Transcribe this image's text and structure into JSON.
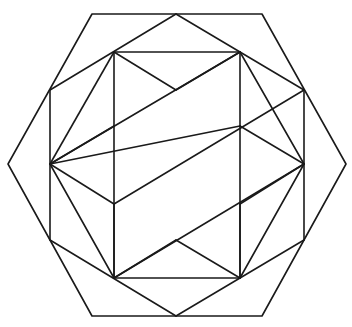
{
  "diagram": {
    "title": "",
    "width": 352,
    "height": 327,
    "stroke_color": "#1a1a1a",
    "background": "#ffffff",
    "outer_hexagon": [
      [
        92,
        14
      ],
      [
        262,
        14
      ],
      [
        346,
        164
      ],
      [
        262,
        316
      ],
      [
        92,
        316
      ],
      [
        8,
        164
      ]
    ],
    "inner_hexagon": [
      [
        50,
        90
      ],
      [
        114,
        52
      ],
      [
        176,
        14
      ],
      [
        240,
        52
      ],
      [
        304,
        90
      ],
      [
        304,
        240
      ],
      [
        240,
        278
      ],
      [
        176,
        316
      ],
      [
        114,
        278
      ],
      [
        50,
        240
      ]
    ],
    "segments": [
      [
        [
          92,
          14
        ],
        [
          262,
          14
        ]
      ],
      [
        [
          262,
          14
        ],
        [
          346,
          164
        ]
      ],
      [
        [
          346,
          164
        ],
        [
          262,
          316
        ]
      ],
      [
        [
          262,
          316
        ],
        [
          92,
          316
        ]
      ],
      [
        [
          92,
          316
        ],
        [
          8,
          164
        ]
      ],
      [
        [
          8,
          164
        ],
        [
          92,
          14
        ]
      ],
      [
        [
          176,
          14
        ],
        [
          50,
          90
        ]
      ],
      [
        [
          176,
          14
        ],
        [
          304,
          90
        ]
      ],
      [
        [
          50,
          90
        ],
        [
          50,
          164
        ]
      ],
      [
        [
          304,
          90
        ],
        [
          304,
          164
        ]
      ],
      [
        [
          114,
          52
        ],
        [
          240,
          52
        ]
      ],
      [
        [
          114,
          52
        ],
        [
          50,
          164
        ]
      ],
      [
        [
          114,
          52
        ],
        [
          114,
          126
        ]
      ],
      [
        [
          114,
          52
        ],
        [
          176,
          90
        ]
      ],
      [
        [
          240,
          52
        ],
        [
          304,
          164
        ]
      ],
      [
        [
          240,
          52
        ],
        [
          240,
          126
        ]
      ],
      [
        [
          240,
          52
        ],
        [
          176,
          90
        ]
      ],
      [
        [
          50,
          164
        ],
        [
          240,
          52
        ]
      ],
      [
        [
          304,
          164
        ],
        [
          114,
          278
        ]
      ],
      [
        [
          50,
          164
        ],
        [
          114,
          126
        ]
      ],
      [
        [
          114,
          126
        ],
        [
          114,
          278
        ]
      ],
      [
        [
          240,
          126
        ],
        [
          304,
          164
        ]
      ],
      [
        [
          240,
          126
        ],
        [
          50,
          164
        ]
      ],
      [
        [
          240,
          126
        ],
        [
          240,
          278
        ]
      ],
      [
        [
          50,
          164
        ],
        [
          50,
          240
        ]
      ],
      [
        [
          304,
          164
        ],
        [
          304,
          240
        ]
      ],
      [
        [
          50,
          164
        ],
        [
          114,
          278
        ]
      ],
      [
        [
          304,
          164
        ],
        [
          240,
          278
        ]
      ],
      [
        [
          50,
          240
        ],
        [
          176,
          316
        ]
      ],
      [
        [
          304,
          240
        ],
        [
          176,
          316
        ]
      ],
      [
        [
          114,
          278
        ],
        [
          240,
          278
        ]
      ],
      [
        [
          114,
          278
        ],
        [
          114,
          204
        ]
      ],
      [
        [
          240,
          278
        ],
        [
          240,
          204
        ]
      ],
      [
        [
          114,
          204
        ],
        [
          304,
          90
        ]
      ],
      [
        [
          240,
          204
        ],
        [
          304,
          164
        ]
      ],
      [
        [
          176,
          240
        ],
        [
          114,
          278
        ]
      ],
      [
        [
          176,
          240
        ],
        [
          240,
          278
        ]
      ],
      [
        [
          114,
          204
        ],
        [
          50,
          164
        ]
      ]
    ]
  }
}
